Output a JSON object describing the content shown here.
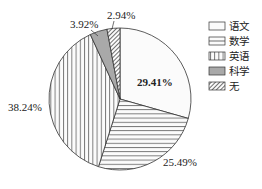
{
  "chart_data": {
    "type": "pie",
    "title": "",
    "categories": [
      "语文",
      "数学",
      "英语",
      "科学",
      "无"
    ],
    "values": [
      29.41,
      25.49,
      38.24,
      3.92,
      2.94
    ],
    "labels": [
      "29.41%",
      "25.49%",
      "38.24%",
      "3.92%",
      "2.94%"
    ],
    "patterns": [
      "blank",
      "horizontal-lines",
      "vertical-lines",
      "gray-fill",
      "diagonal-hatch"
    ],
    "start_angle": "12 o'clock",
    "direction": "clockwise",
    "legend_position": "right"
  },
  "legend": {
    "items": [
      {
        "label": "语文"
      },
      {
        "label": "数学"
      },
      {
        "label": "英语"
      },
      {
        "label": "科学"
      },
      {
        "label": "无"
      }
    ]
  },
  "slice_labels": {
    "yuwen": "29.41%",
    "shuxue": "25.49%",
    "yingyu": "38.24%",
    "kexue": "3.92%",
    "wu": "2.94%"
  }
}
